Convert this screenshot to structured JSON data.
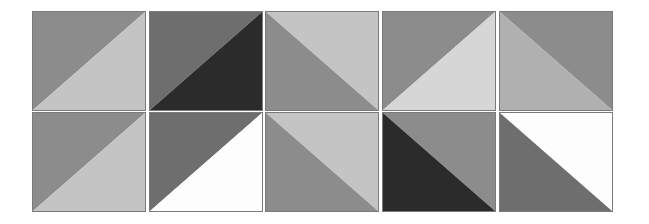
{
  "canvas": {
    "width": 649,
    "height": 224,
    "background": "#ffffff"
  },
  "palette": {
    "dark": "#2b2b2b",
    "mid_dark": "#6e6e6e",
    "mid": "#8c8c8c",
    "light": "#c4c4c4",
    "white": "#fdfdfd",
    "border": "#7a7a7a"
  },
  "columns": [
    {
      "x": 0
    },
    {
      "x": 117
    },
    {
      "x": 233
    },
    {
      "x": 350
    },
    {
      "x": 467
    }
  ],
  "rows": [
    {
      "y": 0
    },
    {
      "y": 101
    }
  ],
  "tiles": [
    {
      "col": 0,
      "row": 0,
      "diagonal": "bl-tr",
      "upper": "#8c8c8c",
      "lower": "#c4c4c4"
    },
    {
      "col": 0,
      "row": 1,
      "diagonal": "bl-tr",
      "upper": "#8c8c8c",
      "lower": "#c4c4c4"
    },
    {
      "col": 1,
      "row": 0,
      "diagonal": "bl-tr",
      "upper": "#6e6e6e",
      "lower": "#2b2b2b"
    },
    {
      "col": 1,
      "row": 1,
      "diagonal": "bl-tr",
      "upper": "#6e6e6e",
      "lower": "#fdfdfd"
    },
    {
      "col": 2,
      "row": 0,
      "diagonal": "tl-br",
      "upper": "#c4c4c4",
      "lower": "#8c8c8c"
    },
    {
      "col": 2,
      "row": 1,
      "diagonal": "tl-br",
      "upper": "#c4c4c4",
      "lower": "#8c8c8c"
    },
    {
      "col": 3,
      "row": 0,
      "diagonal": "bl-tr",
      "upper": "#8c8c8c",
      "lower": "#d6d6d6"
    },
    {
      "col": 3,
      "row": 1,
      "diagonal": "tl-br",
      "upper": "#8c8c8c",
      "lower": "#2b2b2b"
    },
    {
      "col": 4,
      "row": 0,
      "diagonal": "tl-br",
      "upper": "#8c8c8c",
      "lower": "#b0b0b0"
    },
    {
      "col": 4,
      "row": 1,
      "diagonal": "tl-br",
      "upper": "#fdfdfd",
      "lower": "#6e6e6e"
    }
  ]
}
